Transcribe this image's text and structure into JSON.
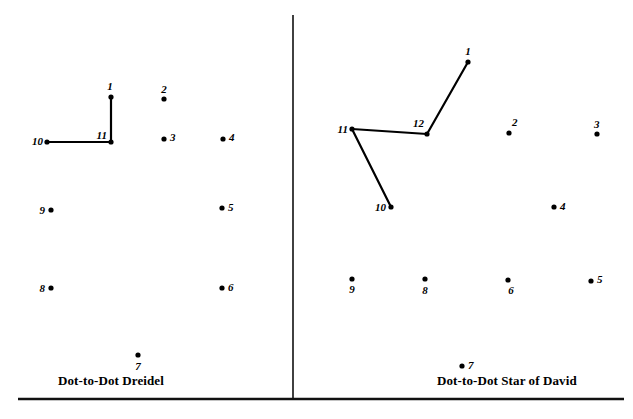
{
  "page": {
    "width": 633,
    "height": 419,
    "background_color": "#ffffff",
    "ink_color": "#000000"
  },
  "divider": {
    "name": "vertical-divider",
    "x": 293,
    "y1": 15,
    "y2": 399
  },
  "baseline_rule": {
    "name": "bottom-rule",
    "x1": 18,
    "x2": 624,
    "y": 399
  },
  "panels": [
    {
      "id": "left",
      "caption": "Dot-to-Dot Dreidel",
      "dots": [
        {
          "label": "1",
          "x": 111,
          "y": 97,
          "lx": 110,
          "ly": 90,
          "anchor": "middle"
        },
        {
          "label": "2",
          "x": 164,
          "y": 99,
          "lx": 164,
          "ly": 93,
          "anchor": "middle"
        },
        {
          "label": "3",
          "x": 164,
          "y": 139,
          "lx": 170,
          "ly": 141,
          "anchor": "start"
        },
        {
          "label": "4",
          "x": 223,
          "y": 139,
          "lx": 229,
          "ly": 141,
          "anchor": "start"
        },
        {
          "label": "5",
          "x": 222,
          "y": 208,
          "lx": 228,
          "ly": 211,
          "anchor": "start"
        },
        {
          "label": "6",
          "x": 222,
          "y": 288,
          "lx": 228,
          "ly": 291,
          "anchor": "start"
        },
        {
          "label": "7",
          "x": 138,
          "y": 355,
          "lx": 138,
          "ly": 370,
          "anchor": "middle"
        },
        {
          "label": "8",
          "x": 51,
          "y": 288,
          "lx": 45,
          "ly": 292,
          "anchor": "end"
        },
        {
          "label": "9",
          "x": 51,
          "y": 210,
          "lx": 45,
          "ly": 214,
          "anchor": "end"
        },
        {
          "label": "10",
          "x": 47,
          "y": 142,
          "lx": 43,
          "ly": 145,
          "anchor": "end"
        },
        {
          "label": "11",
          "x": 111,
          "y": 142,
          "lx": 107,
          "ly": 139,
          "anchor": "end"
        }
      ],
      "connections": [
        {
          "from": "1",
          "to": "11"
        },
        {
          "from": "11",
          "to": "10"
        }
      ]
    },
    {
      "id": "right",
      "caption": "Dot-to-Dot Star of David",
      "dots": [
        {
          "label": "1",
          "x": 468,
          "y": 62,
          "lx": 468,
          "ly": 55,
          "anchor": "middle"
        },
        {
          "label": "2",
          "x": 509,
          "y": 133,
          "lx": 512,
          "ly": 126,
          "anchor": "start"
        },
        {
          "label": "3",
          "x": 597,
          "y": 134,
          "lx": 594,
          "ly": 128,
          "anchor": "start"
        },
        {
          "label": "4",
          "x": 554,
          "y": 207,
          "lx": 560,
          "ly": 210,
          "anchor": "start"
        },
        {
          "label": "5",
          "x": 591,
          "y": 281,
          "lx": 597,
          "ly": 283,
          "anchor": "start"
        },
        {
          "label": "6",
          "x": 508,
          "y": 280,
          "lx": 511,
          "ly": 294,
          "anchor": "middle"
        },
        {
          "label": "7",
          "x": 462,
          "y": 366,
          "lx": 468,
          "ly": 369,
          "anchor": "start"
        },
        {
          "label": "8",
          "x": 425,
          "y": 279,
          "lx": 425,
          "ly": 294,
          "anchor": "middle"
        },
        {
          "label": "9",
          "x": 352,
          "y": 279,
          "lx": 352,
          "ly": 293,
          "anchor": "middle"
        },
        {
          "label": "10",
          "x": 391,
          "y": 207,
          "lx": 386,
          "ly": 211,
          "anchor": "end"
        },
        {
          "label": "11",
          "x": 352,
          "y": 129,
          "lx": 348,
          "ly": 133,
          "anchor": "end"
        },
        {
          "label": "12",
          "x": 427,
          "y": 134,
          "lx": 424,
          "ly": 127,
          "anchor": "end"
        }
      ],
      "connections": [
        {
          "from": "1",
          "to": "12"
        },
        {
          "from": "12",
          "to": "11"
        },
        {
          "from": "11",
          "to": "10"
        }
      ]
    }
  ]
}
